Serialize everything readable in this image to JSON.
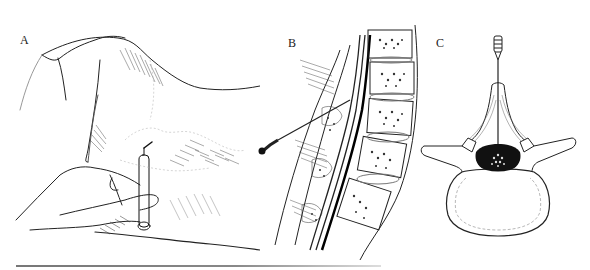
{
  "figure": {
    "panels": [
      {
        "id": "A",
        "label": "A",
        "subject": "patient-lower-back-with-spinal-needle-insertion"
      },
      {
        "id": "B",
        "label": "B",
        "subject": "sagittal-section-lumbar-spine-with-needle"
      },
      {
        "id": "C",
        "label": "C",
        "subject": "axial-view-lumbar-vertebra-with-needle"
      }
    ],
    "colors": {
      "ink": "#1a1a1a",
      "paper": "#ffffff",
      "rule": "#808080"
    }
  }
}
